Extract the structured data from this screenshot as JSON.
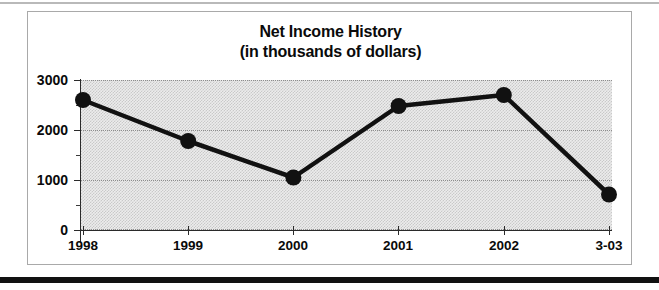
{
  "chart_data": {
    "type": "line",
    "title": "Net Income History",
    "subtitle": "(in thousands of dollars)",
    "xlabel": "",
    "ylabel": "",
    "categories": [
      "1998",
      "1999",
      "2000",
      "2001",
      "2002",
      "3-03"
    ],
    "values": [
      2600,
      1780,
      1050,
      2480,
      2700,
      710
    ],
    "series": [
      {
        "name": "Net Income",
        "values": [
          2600,
          1780,
          1050,
          2480,
          2700,
          710
        ]
      }
    ],
    "ylim": [
      0,
      3000
    ],
    "y_ticks": [
      "0",
      "1000",
      "2000",
      "3000"
    ],
    "y_tick_values": [
      0,
      1000,
      2000,
      3000
    ],
    "y_minor_tick_values": [
      500,
      1500,
      2500
    ],
    "x_tick_labels": [
      "1998",
      "1999",
      "2000",
      "2001",
      "2002",
      "3-03"
    ],
    "grid": true,
    "legend": null,
    "legend_position": "none",
    "marker": "filled-circle",
    "line_color": "#111111",
    "marker_color": "#111111",
    "plot_background": "#ececec",
    "gridline_color": "#8d8d8d",
    "frame_color": "#a9a9a9"
  },
  "figure": {
    "title_line_1": "Net Income History",
    "title_line_2": "(in thousands of dollars)"
  }
}
